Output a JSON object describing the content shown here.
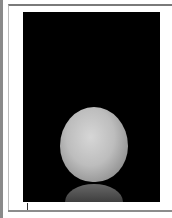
{
  "document": {
    "page_background": "#ffffff",
    "frame_color": "#7a7a7a"
  },
  "image": {
    "subject": "orange-fruit-photo",
    "background_color": "#000000",
    "fruit_color": "#bdbdbd",
    "has_reflection": true
  },
  "cursor": {
    "type": "text-insertion-cursor",
    "glyph": ""
  }
}
